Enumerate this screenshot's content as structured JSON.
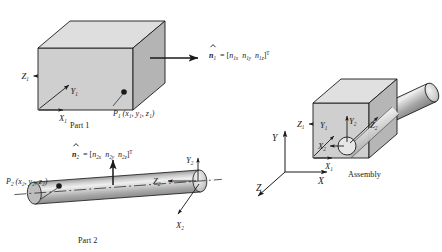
{
  "figure": {
    "background_color": "#ffffff",
    "line_color": "#1a1a1a",
    "face_light": "#d9d9d9",
    "face_mid": "#c9c9c9",
    "face_dark": "#b3b3b3",
    "cyl_light": "#e8e8e8",
    "cyl_mid": "#bdbdbd",
    "cyl_dark": "#8f8f8f"
  },
  "part1": {
    "caption": "Part 1",
    "axes": {
      "z": "Z",
      "z_sub": "1",
      "y": "Y",
      "y_sub": "1",
      "x": "X",
      "x_sub": "1"
    },
    "point": {
      "name": "P",
      "name_sub": "1",
      "coords": "(x₁, y₁, z₁)",
      "coords_plain": "(x1, y1, z1)"
    },
    "normal": {
      "symbol": "n",
      "symbol_sub": "1",
      "equals": "=",
      "open": "[",
      "c1": "n",
      "c1_sub": "1x",
      "c2": "n",
      "c2_sub": "1y",
      "c3": "n",
      "c3_sub": "1z",
      "close": "]",
      "transpose": "T",
      "full": "n̂1 = [ n1x  n1y  n1z ]T"
    }
  },
  "part2": {
    "caption": "Part 2",
    "axes": {
      "y": "Y",
      "y_sub": "2",
      "x": "X",
      "x_sub": "2",
      "z": "Z",
      "z_sub": "2"
    },
    "point": {
      "name": "P",
      "name_sub": "2",
      "coords": "(x₂, y₂, z₂)",
      "coords_plain": "(x2, y2, z2)"
    },
    "normal": {
      "symbol": "n",
      "symbol_sub": "2",
      "equals": "=",
      "open": "[",
      "c1": "n",
      "c1_sub": "2x",
      "c2": "n",
      "c2_sub": "2y",
      "c3": "n",
      "c3_sub": "2z",
      "close": "]",
      "transpose": "T",
      "full": "n̂2 = [ n2x  n2y  n2z ]T"
    }
  },
  "assembly": {
    "caption": "Assembly",
    "local_axes": {
      "z1": "Z",
      "z1_sub": "1",
      "y1": "Y",
      "y1_sub": "1",
      "x1": "X",
      "x1_sub": "1",
      "y2": "Y",
      "y2_sub": "2",
      "z2": "Z",
      "z2_sub": "2",
      "x2": "X",
      "x2_sub": "2"
    }
  },
  "global_frame": {
    "y": "Y",
    "x": "X",
    "z": "Z"
  }
}
